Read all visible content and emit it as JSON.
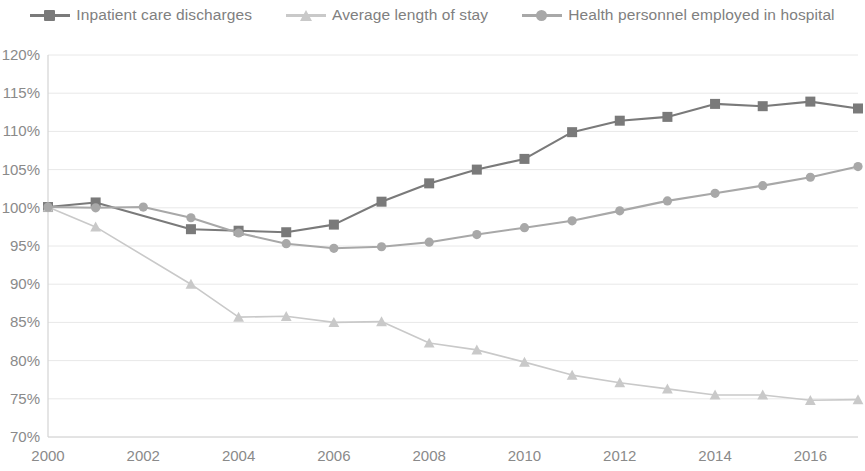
{
  "legend": {
    "position": "top-center",
    "items": [
      {
        "label": "Inpatient care discharges",
        "color": "#7a7a7a",
        "marker": "square"
      },
      {
        "label": "Average length of stay",
        "color": "#c9c9c9",
        "marker": "triangle"
      },
      {
        "label": "Health personnel employed in hospital",
        "color": "#a8a8a8",
        "marker": "circle"
      }
    ]
  },
  "axes": {
    "y_ticks": [
      "70%",
      "75%",
      "80%",
      "85%",
      "90%",
      "95%",
      "100%",
      "105%",
      "110%",
      "115%",
      "120%"
    ],
    "x_ticks": [
      "2000",
      "2002",
      "2004",
      "2006",
      "2008",
      "2010",
      "2012",
      "2014",
      "2016"
    ]
  },
  "chart_data": {
    "type": "line",
    "title": "",
    "subtitle": "",
    "xlabel": "",
    "ylabel": "",
    "xlim": [
      2000,
      2017
    ],
    "ylim": [
      70,
      120
    ],
    "y_tick_step": 5,
    "x_tick_step": 2,
    "grid": true,
    "legend_position": "top-center",
    "value_suffix": "%",
    "x": [
      2000,
      2001,
      2002,
      2003,
      2004,
      2005,
      2006,
      2007,
      2008,
      2009,
      2010,
      2011,
      2012,
      2013,
      2014,
      2015,
      2016,
      2017
    ],
    "series": [
      {
        "name": "Inpatient care discharges",
        "color": "#7a7a7a",
        "marker": "square",
        "values": [
          100.1,
          100.7,
          null,
          97.2,
          97.0,
          96.8,
          97.8,
          100.8,
          103.2,
          105.0,
          106.4,
          109.9,
          111.4,
          111.9,
          113.6,
          113.3,
          113.9,
          113.0
        ]
      },
      {
        "name": "Average length of stay",
        "color": "#c9c9c9",
        "marker": "triangle",
        "values": [
          100.1,
          97.5,
          null,
          90.0,
          85.7,
          85.8,
          85.0,
          85.1,
          82.3,
          81.4,
          79.8,
          78.1,
          77.1,
          76.3,
          75.5,
          75.5,
          74.8,
          74.9
        ]
      },
      {
        "name": "Health personnel employed in hospital",
        "color": "#a8a8a8",
        "marker": "circle",
        "values": [
          100.1,
          100.0,
          100.1,
          98.7,
          96.7,
          95.3,
          94.7,
          94.9,
          95.5,
          96.5,
          97.4,
          98.3,
          99.6,
          100.9,
          101.9,
          102.9,
          104.0,
          105.4
        ]
      }
    ]
  }
}
